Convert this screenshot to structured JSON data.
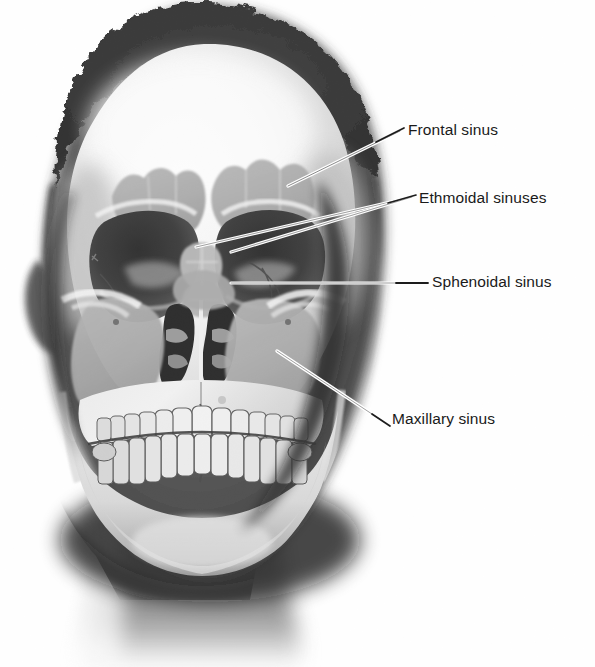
{
  "figure": {
    "image_type": "annotated grayscale radiograph",
    "background_color": "#ffffff",
    "label_text_color": "#1a1a1a",
    "leader_line_light_color": "#ffffff",
    "leader_line_dark_color": "#1c1c1c",
    "dimensions": {
      "width": 595,
      "height": 667
    }
  },
  "labels": [
    {
      "id": "frontal",
      "text": "Frontal sinus",
      "text_x": 408,
      "text_y": 122,
      "leader": {
        "x1": 288,
        "y1": 186,
        "x2": 400,
        "y2": 131
      },
      "structure": "frontal sinus",
      "target_region": "scalloped gray lobes above the orbits in the frontal bone"
    },
    {
      "id": "ethmoidal",
      "text": "Ethmoidal sinuses",
      "text_x": 419,
      "text_y": 190,
      "leader": {
        "x1": 189,
        "y1": 248,
        "x2": 412,
        "y2": 197
      },
      "leader_second": {
        "x1": 231,
        "y1": 251,
        "x2": 412,
        "y2": 197
      },
      "structure": "ethmoidal sinuses (ethmoid air cells)",
      "target_region": "midline cells between the orbits, both sides of the nasal septum"
    },
    {
      "id": "sphenoidal",
      "text": "Sphenoidal sinus",
      "text_x": 432,
      "text_y": 274,
      "leader": {
        "x1": 231,
        "y1": 283,
        "x2": 425,
        "y2": 283
      },
      "structure": "sphenoidal sinus",
      "target_region": "deep midline cavity behind the ethmoid, below the orbits"
    },
    {
      "id": "maxillary",
      "text": "Maxillary sinus",
      "text_x": 392,
      "text_y": 411,
      "leader": {
        "x1": 277,
        "y1": 352,
        "x2": 386,
        "y2": 423
      },
      "structure": "maxillary sinus",
      "target_region": "large gray triangular antrum lateral to the nasal cavity above the upper teeth"
    }
  ],
  "anatomy_notes": {
    "visible_structures": [
      "cranial vault",
      "frontal bone",
      "orbits",
      "nasal cavity and septum",
      "nasal turbinates",
      "zygomatic arches",
      "maxilla with upper dentition",
      "mandible with lower dentition",
      "soft-tissue head silhouette",
      "neck"
    ],
    "teeth_upper_count": 14,
    "teeth_lower_count": 14
  }
}
